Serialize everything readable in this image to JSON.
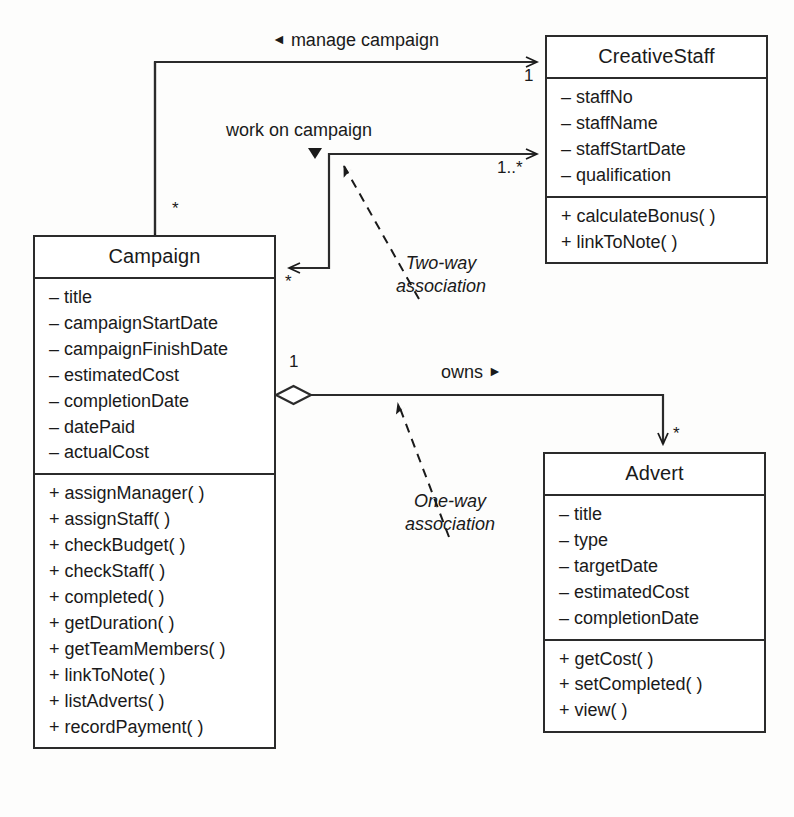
{
  "diagram": {
    "type": "uml-class-diagram",
    "title": "",
    "background_color": "#fdfdfc",
    "line_color": "#2b2b2b"
  },
  "classes": {
    "creative_staff": {
      "name": "CreativeStaff",
      "attributes": [
        "– staffNo",
        "– staffName",
        "– staffStartDate",
        "– qualification"
      ],
      "operations": [
        "+ calculateBonus( )",
        "+ linkToNote( )"
      ]
    },
    "campaign": {
      "name": "Campaign",
      "attributes": [
        "– title",
        "– campaignStartDate",
        "– campaignFinishDate",
        "– estimatedCost",
        "– completionDate",
        "– datePaid",
        "– actualCost"
      ],
      "operations": [
        "+ assignManager( )",
        "+ assignStaff( )",
        "+ checkBudget( )",
        "+ checkStaff( )",
        "+ completed( )",
        "+ getDuration( )",
        "+ getTeamMembers( )",
        "+ linkToNote( )",
        "+ listAdverts( )",
        "+ recordPayment( )"
      ]
    },
    "advert": {
      "name": "Advert",
      "attributes": [
        "– title",
        "– type",
        "– targetDate",
        "– estimatedCost",
        "– completionDate"
      ],
      "operations": [
        "+ getCost( )",
        "+ setCompleted( )",
        "+ view( )"
      ]
    }
  },
  "associations": {
    "manage_campaign": {
      "label": "manage campaign",
      "direction_marker": "◄",
      "source_multiplicity": "*",
      "target_multiplicity": "1"
    },
    "work_on_campaign": {
      "label": "work on campaign",
      "direction_marker": "▼",
      "source_multiplicity": "*",
      "target_multiplicity": "1..*"
    },
    "owns": {
      "label": "owns",
      "direction_marker": "►",
      "source_multiplicity": "1",
      "target_multiplicity": "*"
    }
  },
  "annotations": {
    "two_way": {
      "line1": "Two-way",
      "line2": "association"
    },
    "one_way": {
      "line1": "One-way",
      "line2": "association"
    }
  }
}
